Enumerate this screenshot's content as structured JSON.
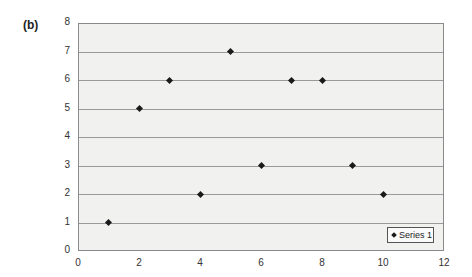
{
  "panel_label": "(b)",
  "chart_data": {
    "type": "scatter",
    "title": "",
    "xlabel": "",
    "ylabel": "",
    "xlim": [
      0,
      12
    ],
    "ylim": [
      0,
      8
    ],
    "x_ticks": [
      0,
      2,
      4,
      6,
      8,
      10,
      12
    ],
    "y_ticks": [
      0,
      1,
      2,
      3,
      4,
      5,
      6,
      7,
      8
    ],
    "grid": {
      "horizontal": true,
      "vertical": false
    },
    "legend_position": "bottom-right inside plot",
    "series": [
      {
        "name": "Series 1",
        "marker": "diamond",
        "color": "#1a1a1a",
        "x": [
          1,
          2,
          3,
          4,
          5,
          6,
          7,
          8,
          9,
          10
        ],
        "y": [
          1,
          5,
          6,
          2,
          7,
          3,
          6,
          6,
          3,
          2
        ]
      }
    ]
  },
  "legend": {
    "label": "Series 1"
  }
}
